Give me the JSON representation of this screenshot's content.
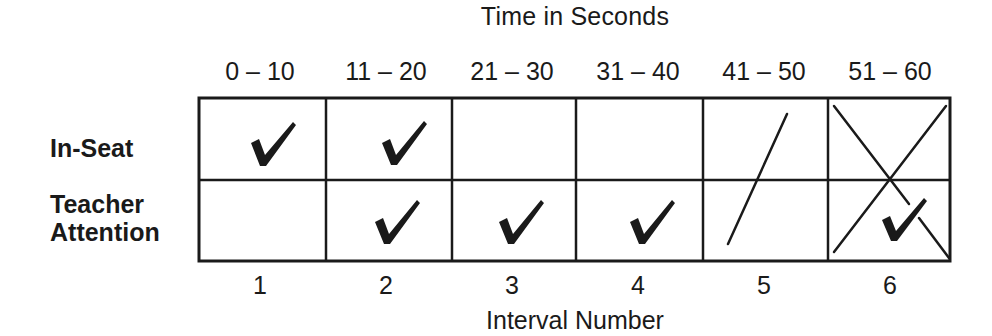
{
  "diagram": {
    "top_title": "Time in Seconds",
    "bottom_title": "Interval Number",
    "columns": [
      {
        "range": "0 – 10",
        "interval": "1"
      },
      {
        "range": "11 – 20",
        "interval": "2"
      },
      {
        "range": "21 – 30",
        "interval": "3"
      },
      {
        "range": "31 – 40",
        "interval": "4"
      },
      {
        "range": "41 – 50",
        "interval": "5"
      },
      {
        "range": "51 – 60",
        "interval": "6"
      }
    ],
    "rows": [
      {
        "label": "In-Seat",
        "marks": [
          "check",
          "check",
          "",
          "",
          "slash",
          "cross"
        ]
      },
      {
        "label_line1": "Teacher",
        "label_line2": "Attention",
        "marks": [
          "",
          "check",
          "check",
          "check",
          "slash",
          "cross+check"
        ]
      }
    ],
    "annotations": {
      "interval_5": "single diagonal slash spanning both rows",
      "interval_6": "large X spanning both rows, with check in Teacher Attention row"
    },
    "colors": {
      "ink": "#1a1a1a",
      "background": "#ffffff"
    }
  }
}
